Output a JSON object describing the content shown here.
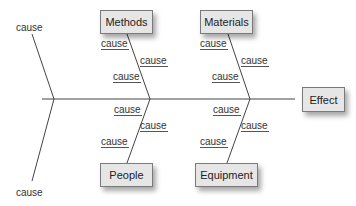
{
  "diagram": {
    "type": "fishbone",
    "effect": "Effect",
    "categories": [
      {
        "name": "Methods",
        "position": "top-left",
        "causes": [
          "cause",
          "cause",
          "cause"
        ]
      },
      {
        "name": "Materials",
        "position": "top-right",
        "causes": [
          "cause",
          "cause",
          "cause"
        ]
      },
      {
        "name": "People",
        "position": "bottom-left",
        "causes": [
          "cause",
          "cause",
          "cause"
        ]
      },
      {
        "name": "Equipment",
        "position": "bottom-right",
        "causes": [
          "cause",
          "cause",
          "cause"
        ]
      }
    ],
    "tail_causes": [
      "cause",
      "cause"
    ]
  }
}
